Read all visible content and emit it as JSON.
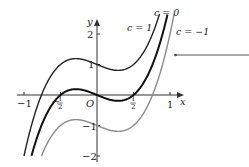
{
  "chart_data": {
    "type": "line",
    "title": "",
    "function": "y = 4x^3 - x + c",
    "xlabel": "x",
    "ylabel": "y",
    "origin_label": "O",
    "xlim": [
      -1.1,
      1.15
    ],
    "ylim": [
      -2.1,
      2.5
    ],
    "grid": false,
    "x_ticks": [
      {
        "value": -1,
        "label": "−1"
      },
      {
        "value": -0.5,
        "label": "−½"
      },
      {
        "value": 0.5,
        "label": "½"
      },
      {
        "value": 1,
        "label": "1"
      }
    ],
    "y_ticks": [
      {
        "value": 2,
        "label": "2"
      },
      {
        "value": 1,
        "label": "1"
      },
      {
        "value": -1,
        "label": "−1"
      },
      {
        "value": -2,
        "label": "−2"
      }
    ],
    "series": [
      {
        "name": "c = 1",
        "c": 1,
        "color": "#222222",
        "width": 1.4
      },
      {
        "name": "c = 0",
        "c": 0,
        "color": "#111111",
        "width": 2.0
      },
      {
        "name": "c = −1",
        "c": -1,
        "color": "#8a8a8a",
        "width": 1.4
      }
    ],
    "annotations": [
      {
        "type": "pointer-arrow",
        "from": [
          249,
          55
        ],
        "to": [
          175,
          55
        ]
      }
    ]
  },
  "labels": {
    "c1": "c = 1",
    "c0": "c = 0",
    "cm1": "c = −1",
    "x": "x",
    "y": "y",
    "origin": "O",
    "xt_m1": "−1",
    "xt_p1": "1",
    "yt_2": "2",
    "yt_1": "1",
    "yt_m1": "−1",
    "yt_m2": "−2"
  }
}
